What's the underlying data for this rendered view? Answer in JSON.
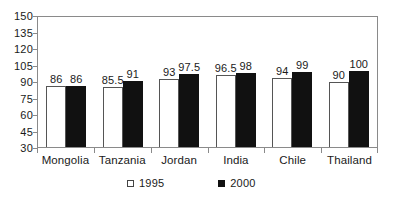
{
  "chart_data": {
    "type": "bar",
    "title": "",
    "subtitle": "",
    "xlabel": "",
    "ylabel": "",
    "categories": [
      "Mongolia",
      "Tanzania",
      "Jordan",
      "India",
      "Chile",
      "Thailand"
    ],
    "series": [
      {
        "name": "1995",
        "marker": "open-square",
        "color": "#ffffff",
        "edge_color": "#555555",
        "values": [
          86,
          85.5,
          93,
          96.5,
          94,
          90
        ],
        "value_labels": [
          "86",
          "85.5",
          "93",
          "96.5",
          "94",
          "90"
        ]
      },
      {
        "name": "2000",
        "marker": "filled-square",
        "color": "#111111",
        "edge_color": "#111111",
        "values": [
          86,
          91,
          97.5,
          98,
          99,
          100
        ],
        "value_labels": [
          "86",
          "91",
          "97.5",
          "98",
          "99",
          "100"
        ]
      }
    ],
    "ylim": [
      30,
      150
    ],
    "ytick_step": 15,
    "yticks": [
      150,
      135,
      120,
      105,
      90,
      75,
      60,
      45,
      30
    ],
    "ytick_labels": [
      "150",
      "135",
      "120",
      "105",
      "90",
      "75",
      "60",
      "45",
      "30"
    ],
    "grid": false,
    "legend_position": "bottom",
    "legend_entries": [
      "1995",
      "2000"
    ],
    "frame": "box",
    "annotations": []
  },
  "legend": {
    "items": [
      {
        "label": "1995",
        "swatch": "open-square-icon"
      },
      {
        "label": "2000",
        "swatch": "filled-square-icon"
      }
    ]
  }
}
